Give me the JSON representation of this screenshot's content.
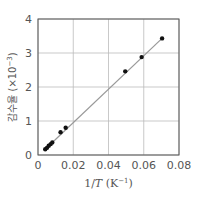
{
  "chart_data": {
    "type": "scatter",
    "title": "",
    "xlabel": "1/T (K⁻¹)",
    "xlabel_parts": {
      "main": "1/",
      "var": "T",
      "unit": "(K",
      "exp": "−1",
      "close": ")"
    },
    "ylabel": "감수율 (×10⁻³)",
    "ylabel_parts": {
      "main": "감수율 (×10",
      "exp": "−3",
      "close": ")"
    },
    "xlim": [
      0,
      0.08
    ],
    "ylim": [
      0,
      4
    ],
    "xticks": [
      "0",
      "0.02",
      "0.04",
      "0.06",
      "0.08"
    ],
    "yticks": [
      "0",
      "1",
      "2",
      "3",
      "4"
    ],
    "grid": true,
    "legend": null,
    "series": [
      {
        "name": "measured",
        "marker": "circle",
        "color": "#111111",
        "x": [
          0.0041,
          0.0051,
          0.0061,
          0.0072,
          0.0081,
          0.0128,
          0.0157,
          0.0495,
          0.0588,
          0.0704
        ],
        "y": [
          0.17,
          0.21,
          0.27,
          0.32,
          0.37,
          0.67,
          0.8,
          2.46,
          2.88,
          3.43
        ]
      }
    ],
    "fit_line": {
      "color": "#999999",
      "x": [
        0.0041,
        0.0704
      ],
      "y": [
        0.17,
        3.43
      ]
    }
  },
  "colors": {
    "axis": "#555555",
    "grid": "#bbbbbb",
    "point": "#111111",
    "line": "#999999"
  }
}
